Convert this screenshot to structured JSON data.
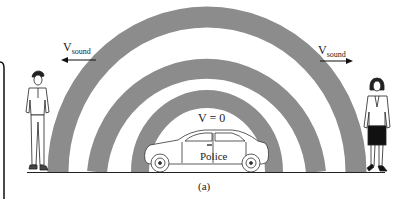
{
  "figure": {
    "caption": "(a)",
    "colors": {
      "wave_band": "#8c8c8c",
      "background": "#ffffff",
      "line": "#222222"
    }
  },
  "labels": {
    "left_velocity": {
      "base": "V",
      "sub": "sound",
      "arrow": "left"
    },
    "right_velocity": {
      "base": "V",
      "sub": "sound",
      "arrow": "right"
    },
    "car_velocity": "V = 0",
    "car_text": "Police"
  },
  "observers": [
    {
      "id": "left",
      "label": "man-observer"
    },
    {
      "id": "right",
      "label": "woman-observer"
    }
  ],
  "wavefronts": {
    "count": 3,
    "center_x": 207,
    "baseline_y": 172
  }
}
